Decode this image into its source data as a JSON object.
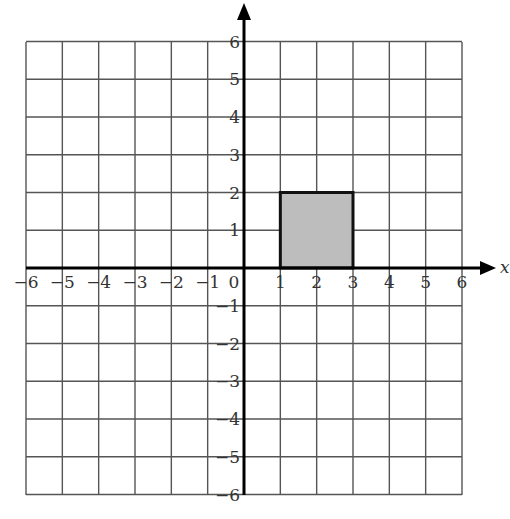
{
  "diagram": {
    "type": "coordinate-grid",
    "x_axis": {
      "label": "x",
      "min": -6,
      "max": 6,
      "ticks": [
        "-6",
        "-5",
        "-4",
        "-3",
        "-2",
        "-1",
        "0",
        "1",
        "2",
        "3",
        "4",
        "5",
        "6"
      ]
    },
    "y_axis": {
      "label": "",
      "min": -6,
      "max": 6,
      "ticks": [
        "6",
        "5",
        "4",
        "3",
        "2",
        "1",
        "-1",
        "-2",
        "-3",
        "-4",
        "-5",
        "-6"
      ]
    },
    "origin_label": "0",
    "shape": {
      "name": "shaded-rectangle",
      "vertices": [
        [
          1,
          0
        ],
        [
          3,
          0
        ],
        [
          3,
          2
        ],
        [
          1,
          2
        ]
      ],
      "fill": "#bdbdbd",
      "stroke": "#111111"
    },
    "colors": {
      "grid": "#555555",
      "axis": "#000000",
      "text": "#333333",
      "background": "#ffffff"
    }
  }
}
